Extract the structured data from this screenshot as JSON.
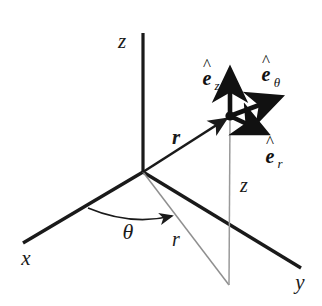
{
  "figure": {
    "name": "cylindrical-coordinate-system-diagram",
    "background_color": "#ffffff",
    "stroke_color": "#1a1a1a",
    "thin_stroke_color": "#8a8a8a",
    "width": 322,
    "height": 306
  },
  "axes": {
    "x_label": "x",
    "y_label": "y",
    "z_label": "z"
  },
  "vectors": {
    "position_vector_label": "r",
    "unit_radial": {
      "base": "e",
      "hat": "^",
      "subscript": "r"
    },
    "unit_azimuthal": {
      "base": "e",
      "hat": "^",
      "subscript": "θ"
    },
    "unit_axial": {
      "base": "e",
      "hat": "^",
      "subscript": "z"
    }
  },
  "coordinates": {
    "radial_label": "r",
    "azimuthal_label": "θ",
    "axial_label": "z"
  }
}
